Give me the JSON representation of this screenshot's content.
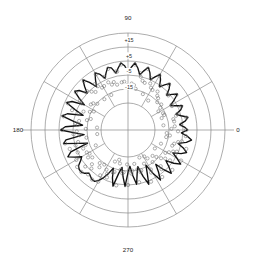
{
  "chart_data": {
    "type": "line",
    "subtype": "polar",
    "title": "",
    "xlabel": "",
    "ylabel": "",
    "grid": true,
    "legend_position": "none",
    "angular_axis": {
      "unit": "degrees",
      "range": [
        0,
        360
      ],
      "direction": "counterclockwise",
      "zero_at": "east",
      "spoke_interval": 30,
      "tick_labels": [
        "0",
        "90",
        "180",
        "270"
      ],
      "tick_values": [
        0,
        90,
        180,
        270
      ]
    },
    "radial_axis": {
      "unit": "dB",
      "tick_labels": [
        "+15",
        "+5",
        "-5",
        "-15"
      ],
      "tick_values": [
        15,
        5,
        -5,
        -15
      ],
      "rlim": [
        -25,
        20
      ],
      "rings": 5,
      "inner_hub_value": -25
    },
    "series": [
      {
        "name": "measured",
        "style": "solid-line",
        "color": "#111111",
        "theta": [
          0,
          3,
          6,
          9,
          12,
          15,
          18,
          21,
          24,
          27,
          30,
          33,
          36,
          39,
          42,
          45,
          48,
          51,
          54,
          57,
          60,
          63,
          66,
          69,
          72,
          75,
          78,
          81,
          84,
          87,
          90,
          93,
          96,
          99,
          102,
          105,
          108,
          111,
          114,
          117,
          120,
          123,
          126,
          129,
          132,
          135,
          138,
          141,
          144,
          147,
          150,
          153,
          156,
          159,
          162,
          165,
          168,
          171,
          174,
          177,
          180,
          183,
          186,
          189,
          192,
          195,
          198,
          201,
          204,
          207,
          210,
          213,
          216,
          219,
          222,
          225,
          228,
          231,
          234,
          237,
          240,
          243,
          246,
          249,
          252,
          255,
          258,
          261,
          264,
          267,
          270,
          273,
          276,
          279,
          282,
          285,
          288,
          291,
          294,
          297,
          300,
          303,
          306,
          309,
          312,
          315,
          318,
          321,
          324,
          327,
          330,
          333,
          336,
          339,
          342,
          345,
          348,
          351,
          354,
          357
        ],
        "r": [
          -4,
          -6,
          -9,
          -5,
          -3,
          -7,
          -10,
          -6,
          -4,
          -8,
          -11,
          -7,
          -3,
          -6,
          -9,
          -5,
          -2,
          -5,
          -8,
          -4,
          -1,
          -4,
          -7,
          -3,
          0,
          -3,
          -6,
          -2,
          1,
          -2,
          -5,
          -1,
          1,
          -2,
          -5,
          -1,
          0,
          -3,
          -6,
          -2,
          0,
          -4,
          -8,
          -3,
          1,
          -3,
          -7,
          -2,
          0,
          -5,
          -10,
          -2,
          1,
          -6,
          -12,
          -2,
          1,
          -7,
          -13,
          -2,
          1,
          -8,
          -14,
          -2,
          0,
          -9,
          -15,
          -3,
          0,
          -4,
          -8,
          -6,
          -3,
          -2,
          -2,
          -3,
          -5,
          -4,
          -3,
          -3,
          -5,
          -8,
          -12,
          -16,
          -10,
          -5,
          -14,
          -18,
          -12,
          -6,
          -15,
          -19,
          -13,
          -7,
          -14,
          -18,
          -11,
          -5,
          -12,
          -17,
          -10,
          -4,
          -9,
          -14,
          -8,
          -3,
          -7,
          -11,
          -6,
          -2,
          -6,
          -10,
          -5,
          -2,
          -5,
          -9,
          -4,
          -1,
          -4,
          -8,
          -4
        ]
      },
      {
        "name": "simulated",
        "style": "open-circle-markers",
        "color": "#6e6e6e",
        "theta": [
          0,
          6,
          12,
          18,
          24,
          30,
          36,
          42,
          48,
          54,
          60,
          66,
          72,
          78,
          84,
          90,
          96,
          102,
          108,
          114,
          120,
          126,
          132,
          138,
          144,
          150,
          156,
          162,
          168,
          174,
          180,
          186,
          192,
          198,
          204,
          210,
          216,
          222,
          228,
          234,
          240,
          246,
          252,
          258,
          264,
          270,
          276,
          282,
          288,
          294,
          300,
          306,
          312,
          318,
          324,
          330,
          336,
          342,
          348,
          354
        ],
        "r": [
          -5,
          -8,
          -4,
          -9,
          -5,
          -10,
          -4,
          -8,
          -3,
          -7,
          -2,
          -6,
          -1,
          -5,
          0,
          -4,
          0,
          -4,
          -1,
          -5,
          -1,
          -6,
          0,
          -6,
          -1,
          -8,
          0,
          -9,
          0,
          -10,
          0,
          -11,
          -1,
          -3,
          -7,
          -4,
          -2,
          -2,
          -4,
          -3,
          -4,
          -9,
          -14,
          -6,
          -15,
          -7,
          -16,
          -8,
          -15,
          -6,
          -13,
          -5,
          -11,
          -4,
          -9,
          -3,
          -8,
          -3,
          -7,
          -5
        ]
      }
    ],
    "annotations": [
      {
        "text": "large side lobe extending toward 210 degrees",
        "theta": 212,
        "r": 5
      }
    ]
  },
  "angle_labels": {
    "east": "0",
    "north": "90",
    "west": "180",
    "south": "270"
  },
  "radial_labels": {
    "r1": "+15",
    "r2": "+5",
    "r3": "-5",
    "r4": "-15"
  },
  "colors": {
    "grid": "#8a8a8a",
    "line": "#111111",
    "marker": "#6e6e6e",
    "background": "#ffffff",
    "text": "#1a1a1a"
  }
}
